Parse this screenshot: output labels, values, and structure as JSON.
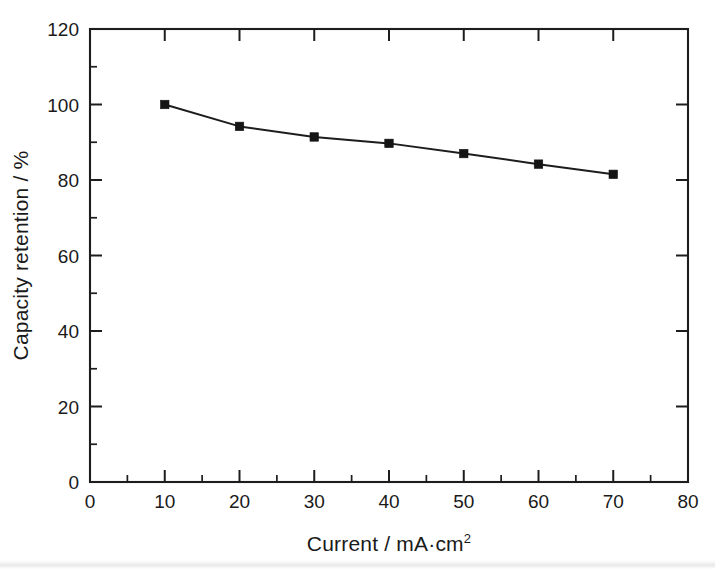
{
  "chart_data": {
    "type": "line",
    "title": "",
    "subtitle": "",
    "xlabel_parts": {
      "base": "Current / mA·cm",
      "superscript": "2"
    },
    "xlabel": "Current / mA·cm2",
    "ylabel": "Capacity retention / %",
    "x": [
      10,
      20,
      30,
      40,
      50,
      60,
      70
    ],
    "values": [
      100.0,
      94.2,
      91.4,
      89.7,
      87.0,
      84.2,
      81.5
    ],
    "series": [
      {
        "name": "Capacity retention",
        "x": [
          10,
          20,
          30,
          40,
          50,
          60,
          70
        ],
        "values": [
          100.0,
          94.2,
          91.4,
          89.7,
          87.0,
          84.2,
          81.5
        ],
        "marker": "square",
        "marker_color": "#151515",
        "line_color": "#1d1d1d"
      }
    ],
    "xlim": [
      0,
      80
    ],
    "ylim": [
      0,
      120
    ],
    "xticks": [
      0,
      10,
      20,
      30,
      40,
      50,
      60,
      70,
      80
    ],
    "yticks": [
      0,
      20,
      40,
      60,
      80,
      100,
      120
    ],
    "xticklabels": [
      "0",
      "10",
      "20",
      "30",
      "40",
      "50",
      "60",
      "70",
      "80"
    ],
    "yticklabels": [
      "0",
      "20",
      "40",
      "60",
      "80",
      "100",
      "120"
    ],
    "x_minor_step": 5,
    "y_minor_step": 10,
    "grid": false,
    "legend": null,
    "legend_position": "none",
    "annotations": [],
    "frame": "box",
    "tick_direction": "in",
    "background_color": "#ffffff",
    "foreground_color": "#1d1d1d"
  }
}
